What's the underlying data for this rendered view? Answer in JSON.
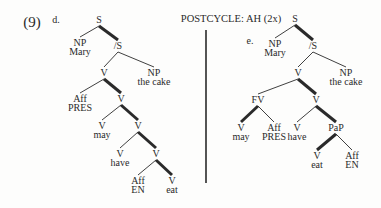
{
  "example_number": "(9)",
  "header": "POSTCYCLE: AH (2x)",
  "divider": {
    "x": 206,
    "y1": 30,
    "y2": 183
  },
  "trees": [
    {
      "label": "d.",
      "label_pos": [
        56,
        20
      ],
      "nodes": [
        {
          "id": "S",
          "text": "S",
          "x": 99,
          "y": 20
        },
        {
          "id": "NP1",
          "text": "NP",
          "x": 80,
          "y": 43,
          "sub": "Mary"
        },
        {
          "id": "S2",
          "text": "/S",
          "x": 118,
          "y": 46
        },
        {
          "id": "V1",
          "text": "V",
          "x": 104,
          "y": 73
        },
        {
          "id": "NP2",
          "text": "NP",
          "x": 154,
          "y": 73,
          "sub": "the cake"
        },
        {
          "id": "Aff1",
          "text": "Aff",
          "x": 80,
          "y": 99,
          "sub": "PRES"
        },
        {
          "id": "V2",
          "text": "V",
          "x": 121,
          "y": 99
        },
        {
          "id": "Vmay",
          "text": "V",
          "x": 102,
          "y": 126,
          "sub": "may"
        },
        {
          "id": "V3",
          "text": "V",
          "x": 138,
          "y": 126
        },
        {
          "id": "Vhave",
          "text": "V",
          "x": 120,
          "y": 154,
          "sub": "have"
        },
        {
          "id": "V4",
          "text": "V",
          "x": 156,
          "y": 154
        },
        {
          "id": "Aff2",
          "text": "Aff",
          "x": 138,
          "y": 181,
          "sub": "EN"
        },
        {
          "id": "Veat",
          "text": "V",
          "x": 172,
          "y": 181,
          "sub": "eat"
        }
      ],
      "edges": [
        {
          "from": "S",
          "to": "NP1",
          "bold": false
        },
        {
          "from": "S",
          "to": "S2",
          "bold": true
        },
        {
          "from": "S2",
          "to": "V1",
          "bold": false
        },
        {
          "from": "S2",
          "to": "NP2",
          "bold": false
        },
        {
          "from": "V1",
          "to": "Aff1",
          "bold": false
        },
        {
          "from": "V1",
          "to": "V2",
          "bold": true
        },
        {
          "from": "V2",
          "to": "Vmay",
          "bold": false
        },
        {
          "from": "V2",
          "to": "V3",
          "bold": true
        },
        {
          "from": "V3",
          "to": "Vhave",
          "bold": false
        },
        {
          "from": "V3",
          "to": "V4",
          "bold": true
        },
        {
          "from": "V4",
          "to": "Aff2",
          "bold": false
        },
        {
          "from": "V4",
          "to": "Veat",
          "bold": true
        }
      ]
    },
    {
      "label": "e.",
      "label_pos": [
        250,
        41
      ],
      "nodes": [
        {
          "id": "S",
          "text": "S",
          "x": 295,
          "y": 19
        },
        {
          "id": "NP1",
          "text": "NP",
          "x": 275,
          "y": 44,
          "sub": "Mary"
        },
        {
          "id": "S2",
          "text": "/S",
          "x": 313,
          "y": 46
        },
        {
          "id": "V1",
          "text": "V",
          "x": 298,
          "y": 73
        },
        {
          "id": "NP2",
          "text": "NP",
          "x": 346,
          "y": 73,
          "sub": "the cake"
        },
        {
          "id": "FV",
          "text": "FV",
          "x": 258,
          "y": 100
        },
        {
          "id": "V2",
          "text": "V",
          "x": 316,
          "y": 100
        },
        {
          "id": "Vmay",
          "text": "V",
          "x": 241,
          "y": 128,
          "sub": "may"
        },
        {
          "id": "Aff1",
          "text": "Aff",
          "x": 274,
          "y": 128,
          "sub": "PRES"
        },
        {
          "id": "Vhave",
          "text": "V",
          "x": 297,
          "y": 128,
          "sub": "have"
        },
        {
          "id": "PaP",
          "text": "PaP",
          "x": 336,
          "y": 128
        },
        {
          "id": "Veat",
          "text": "V",
          "x": 317,
          "y": 156,
          "sub": "eat"
        },
        {
          "id": "Aff2",
          "text": "Aff",
          "x": 352,
          "y": 156,
          "sub": "EN"
        }
      ],
      "edges": [
        {
          "from": "S",
          "to": "NP1",
          "bold": false
        },
        {
          "from": "S",
          "to": "S2",
          "bold": true
        },
        {
          "from": "S2",
          "to": "V1",
          "bold": false
        },
        {
          "from": "S2",
          "to": "NP2",
          "bold": false
        },
        {
          "from": "V1",
          "to": "FV",
          "bold": false
        },
        {
          "from": "V1",
          "to": "V2",
          "bold": true
        },
        {
          "from": "FV",
          "to": "Vmay",
          "bold": true
        },
        {
          "from": "FV",
          "to": "Aff1",
          "bold": false
        },
        {
          "from": "V2",
          "to": "Vhave",
          "bold": false
        },
        {
          "from": "V2",
          "to": "PaP",
          "bold": true
        },
        {
          "from": "PaP",
          "to": "Veat",
          "bold": true
        },
        {
          "from": "PaP",
          "to": "Aff2",
          "bold": false
        }
      ]
    }
  ],
  "colors": {
    "ink": "#2a2a2a",
    "paper": "#fdfdfc"
  }
}
